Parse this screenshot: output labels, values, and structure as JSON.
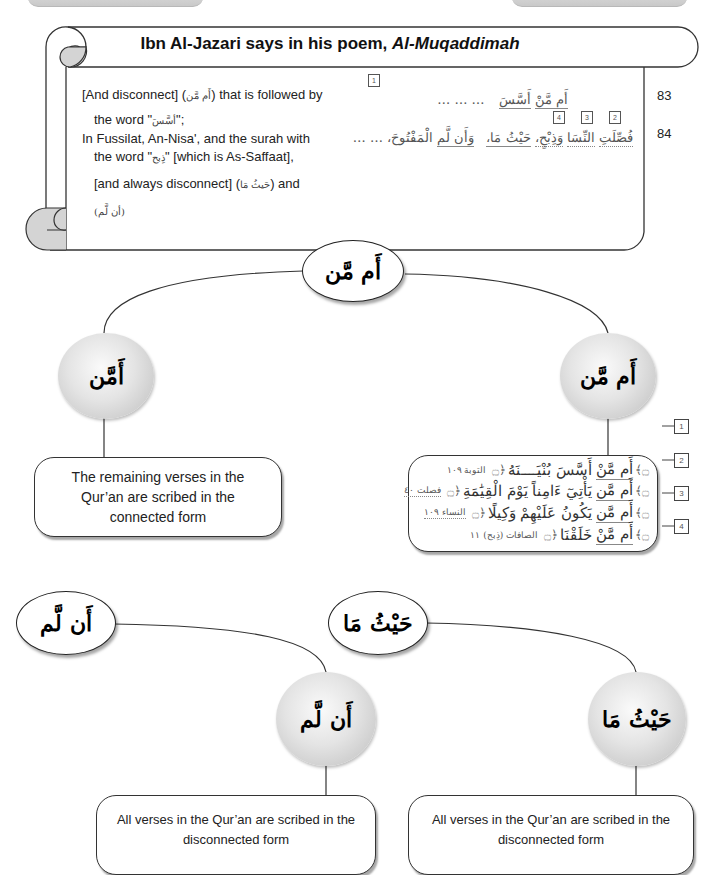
{
  "header": {
    "title_prefix": "Ibn Al-Jazari says in his poem, ",
    "title_italic": "Al-Muqaddimah"
  },
  "poem": {
    "translation": {
      "l1_a": "[And disconnect] (",
      "l1_ar": "أَم مَّن",
      "l1_b": ") that is followed by",
      "l2_a": "the word \"",
      "l2_ar": "أسَّسَ",
      "l2_b": "\";",
      "l3": "In Fussilat, An-Nisa', and the surah with",
      "l4_a": "the word \"",
      "l4_ar": "ذِبح",
      "l4_b": "\" [which is As-Saffaat],",
      "l5_a": "[and always disconnect] (",
      "l5_ar": "حَيثُ مَا",
      "l5_b": ") and",
      "l6": "(أن لَّم)"
    },
    "verses": [
      {
        "line_no": "83",
        "dots": "… … …",
        "w1": "أَم مَّنْ",
        "w2": "أَسَّسَ",
        "markers": [
          "1"
        ]
      },
      {
        "line_no": "84",
        "w_fussilat": "فُصِّلَتِ",
        "w_nisa": "النِّسَا",
        "w_dhibh": "وَذِبْحٍ،",
        "w_haythu": "حَيْثُ مَا،",
        "w_wan": "وَأَن لَّم",
        "w_maftuh": "الْمَفْتُوحَ، … …",
        "markers": [
          "4",
          "3",
          "2"
        ]
      }
    ]
  },
  "diagram_top": {
    "root": "أَم مَّن",
    "left_node": "أَمَّن",
    "right_node": "أَم مَّن",
    "left_box": "The remaining verses in the Qur’an are scribed in the connected form",
    "right_box": {
      "verses": [
        {
          "num": "1",
          "lead": "أَم مَّنْ",
          "text": "أَسَّسَ بُنْيَــــنَهُ",
          "ref": "التوبة ١٠٩"
        },
        {
          "num": "2",
          "lead": "أَم مَّن",
          "text": "يَأْتِيٓ ءَامِناً يَوْمَ الْقِيَٰمَةِ",
          "ref": "فصلت ٤٠"
        },
        {
          "num": "3",
          "lead": "أَم مَّن",
          "text": "يَكُونُ عَلَيْهِمْ وَكِيلًا",
          "ref": "النساء ١٠٩"
        },
        {
          "num": "4",
          "lead": "أَم مَّنْ",
          "text": "خَلَقْنَا",
          "ref": "الصافات (ذِبح) ١١"
        }
      ],
      "ornament_open": "۝﴾",
      "ornament_close": "﴿۝"
    }
  },
  "diagram_bottom": {
    "an_lam": {
      "root": "أَن لَّم",
      "node": "أَن لَّم",
      "box": "All verses in the Qur’an are scribed in the disconnected form"
    },
    "haythu_ma": {
      "root": "حَيْثُ مَا",
      "node": "حَيْثُ مَا",
      "box": "All verses in the Qur’an are scribed in the disconnected form"
    }
  }
}
